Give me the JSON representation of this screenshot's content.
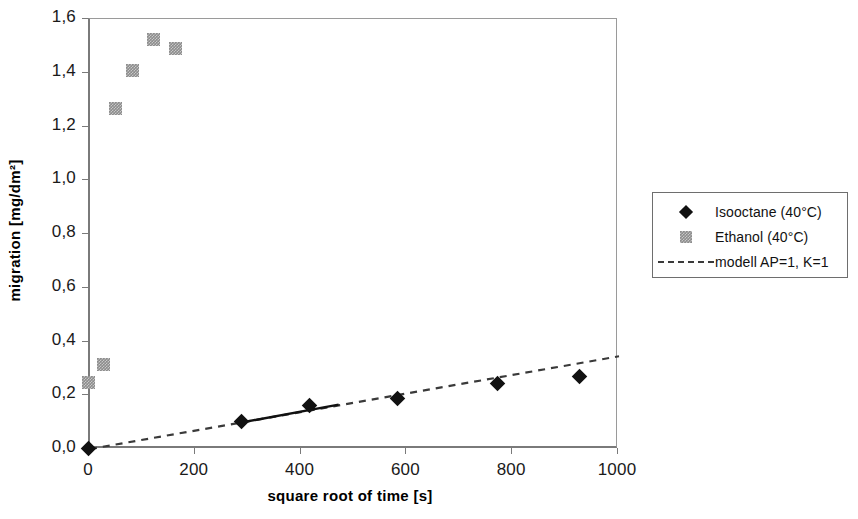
{
  "chart_data": {
    "type": "scatter",
    "title": "",
    "xlabel": "square root of time [s]",
    "ylabel": "migration [mg/dm²]",
    "xlim": [
      0,
      1000
    ],
    "ylim": [
      0,
      1.6
    ],
    "xticks": [
      "0",
      "200",
      "400",
      "600",
      "800",
      "1000"
    ],
    "xtick_values": [
      0,
      200,
      400,
      600,
      800,
      1000
    ],
    "yticks": [
      "0,0",
      "0,2",
      "0,4",
      "0,6",
      "0,8",
      "1,0",
      "1,2",
      "1,4",
      "1,6"
    ],
    "ytick_values": [
      0.0,
      0.2,
      0.4,
      0.6,
      0.8,
      1.0,
      1.2,
      1.4,
      1.6
    ],
    "grid": false,
    "legend_position": "right",
    "decimal_separator": ",",
    "series": [
      {
        "name": "Isooctane (40°C)",
        "marker": "diamond",
        "color": "#111111",
        "x": [
          0,
          290,
          418,
          585,
          775,
          930
        ],
        "y": [
          0.0,
          0.1,
          0.16,
          0.185,
          0.24,
          0.265
        ]
      },
      {
        "name": "Ethanol (40°C)",
        "marker": "square",
        "color": "#8c8c8c",
        "x": [
          0,
          30,
          52,
          85,
          123,
          165
        ],
        "y": [
          0.245,
          0.31,
          1.265,
          1.405,
          1.52,
          1.485
        ]
      },
      {
        "name": "modell AP=1, K=1",
        "marker": "none",
        "style": "dashed",
        "color": "#3a3a3a",
        "x": [
          0,
          1000
        ],
        "y": [
          0.0,
          0.345
        ]
      }
    ],
    "trend_overlay": {
      "name": "isooctane-fit-segment",
      "style": "solid",
      "color": "#111111",
      "x": [
        290,
        470
      ],
      "y": [
        0.1,
        0.165
      ]
    }
  },
  "legend": {
    "entries": [
      {
        "label": "Isooctane (40°C)",
        "key": "diamond"
      },
      {
        "label": "Ethanol (40°C)",
        "key": "square"
      },
      {
        "label": "modell AP=1, K=1",
        "key": "dashed-line"
      }
    ]
  }
}
